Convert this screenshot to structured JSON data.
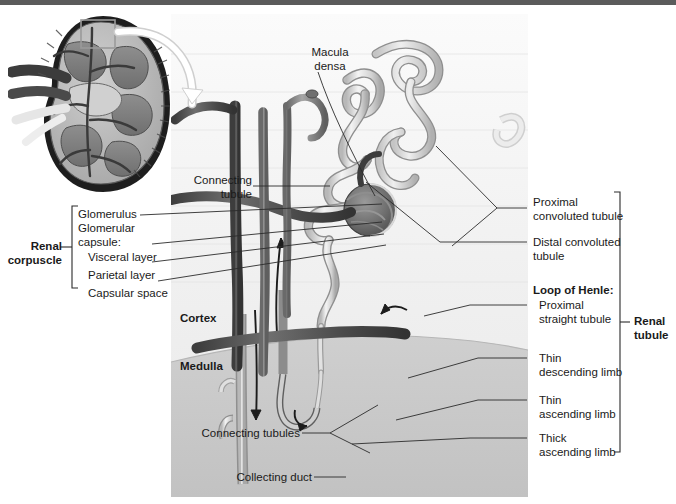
{
  "colors": {
    "panel_background": "#f2f2f2",
    "medulla_fill": "#c9c9c9",
    "cortex_fill": "#ececec",
    "leader_line": "#2b2b2b",
    "text": "#1a1a1a",
    "top_strip": "#5b5b5b",
    "artery_dark": "#4a4a4a",
    "vein_mid": "#8a8a8a",
    "tubule_light": "#dcdcdc"
  },
  "inset": {
    "name": "kidney-cross-section",
    "callout_box": "magnified region"
  },
  "labels": {
    "macula_densa": "Macula\ndensa",
    "connecting_tubule": "Connecting\ntubule",
    "renal_corpuscle": "Renal\ncorpuscle",
    "glomerulus": "Glomerulus",
    "glomerular_capsule": "Glomerular\ncapsule:",
    "visceral_layer": "Visceral layer",
    "parietal_layer": "Parietal layer",
    "capsular_space": "Capsular space",
    "cortex": "Cortex",
    "medulla": "Medulla",
    "connecting_tubules": "Connecting tubules",
    "collecting_duct": "Collecting duct",
    "proximal_convoluted_tubule": "Proximal\nconvoluted tubule",
    "distal_convoluted_tubule": "Distal convoluted\ntubule",
    "loop_of_henle": "Loop of Henle:",
    "proximal_straight_tubule": "Proximal\nstraight tubule",
    "thin_descending_limb": "Thin\ndescending limb",
    "thin_ascending_limb": "Thin\nascending limb",
    "thick_ascending_limb": "Thick\nascending limb",
    "renal_tubule": "Renal\ntubule"
  }
}
